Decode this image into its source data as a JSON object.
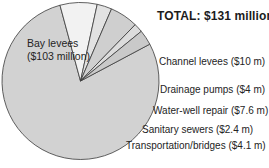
{
  "title": "TOTAL: $131 million",
  "inner_label": {
    "line1": "Bay levees",
    "line2": "($103 million)"
  },
  "callouts": [
    "Channel levees ($10 m)",
    "Drainage pumps ($4 m)",
    "Water-well repair ($7.6 m)",
    "Sanitary sewers ($2.4 m)",
    "Transportation/bridges ($4.1 m)"
  ],
  "colors": {
    "bay_levees": "#d2d2d2",
    "channel_levees": "#f2f2f2",
    "drainage_pumps": "#e2e2e2",
    "water_well_repair": "#cfcfcf",
    "sanitary_sewers": "#dcdcdc",
    "transportation_bridges": "#c9c9c9",
    "outline": "#3a3a3a",
    "text": "#242424",
    "background": "#ffffff"
  },
  "chart_data": {
    "type": "pie",
    "title": "TOTAL: $131 million",
    "total": 131,
    "units": "millions of US dollars",
    "legend": "callout labels placed to the right of each wedge",
    "grid": false,
    "labels": [
      "Bay levees",
      "Channel levees",
      "Drainage pumps",
      "Water-well repair",
      "Sanitary sewers",
      "Transportation/bridges"
    ],
    "values": [
      103,
      10,
      4,
      7.6,
      2.4,
      4.1
    ],
    "value_labels": [
      "$103 million",
      "$10 m",
      "$4 m",
      "$7.6 m",
      "$2.4 m",
      "$4.1 m"
    ],
    "slice_colors": [
      "#d2d2d2",
      "#f2f2f2",
      "#e2e2e2",
      "#cfcfcf",
      "#dcdcdc",
      "#c9c9c9"
    ]
  }
}
